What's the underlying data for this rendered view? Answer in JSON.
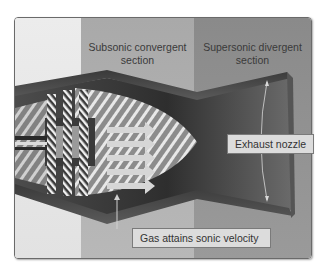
{
  "diagram": {
    "type": "convergent-divergent nozzle cutaway",
    "sections": [
      {
        "id": "inlet",
        "label": "",
        "color": "#e6e6e6"
      },
      {
        "id": "subsonic",
        "label_line1": "Subsonic convergent",
        "label_line2": "section",
        "color": "#b0b0b0"
      },
      {
        "id": "supersonic",
        "label_line1": "Supersonic divergent",
        "label_line2": "section",
        "color": "#929292"
      }
    ],
    "callouts": {
      "exhaust_nozzle": "Exhaust nozzle",
      "gas_sonic": "Gas attains sonic velocity"
    },
    "flow_arrows": 5,
    "colors": {
      "wall": "#4a4a4a",
      "nozzle_interior": "#5c5c5c",
      "arrow": "#d4d4d4",
      "cone": "#8a8a8a",
      "callout_bg": "#dcdcdc"
    }
  }
}
